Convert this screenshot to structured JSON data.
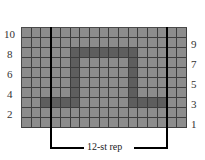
{
  "chart": {
    "columns": 17,
    "rows": 10,
    "colors": {
      "background_cell": "#8c8c8c",
      "contrast_cell": "#5e5e5e",
      "grid_line": "#3c3c3c",
      "repeat_line": "#000000"
    },
    "left_row_labels": [
      "10",
      "8",
      "6",
      "4",
      "2"
    ],
    "right_row_labels": [
      "9",
      "7",
      "5",
      "3",
      "1"
    ],
    "repeat_label": "12-st rep",
    "repeat_start_column": 3,
    "repeat_end_column": 14,
    "dark_cells": [
      {
        "row": 8,
        "cols": [
          5,
          6,
          7,
          8,
          9,
          10,
          11
        ]
      },
      {
        "row": 7,
        "cols": [
          5,
          11
        ]
      },
      {
        "row": 6,
        "cols": [
          5,
          11
        ]
      },
      {
        "row": 5,
        "cols": [
          5,
          11
        ]
      },
      {
        "row": 4,
        "cols": [
          5,
          11
        ]
      },
      {
        "row": 3,
        "cols": [
          2,
          3,
          4,
          5,
          11,
          12,
          13,
          14
        ]
      }
    ]
  }
}
